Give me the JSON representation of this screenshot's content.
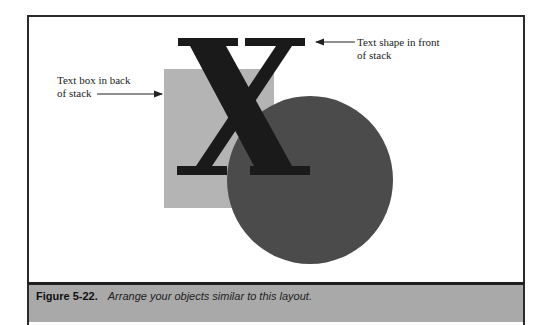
{
  "figure": {
    "annotations": {
      "front": "Text shape in front\nof stack",
      "back": "Text box in back\nof stack"
    },
    "shapes": {
      "letter": "X",
      "colors": {
        "letter": "#1a1a1a",
        "text_box": "#b4b4b4",
        "circle": "#4b4b4b",
        "caption_band": "#a9a9a9"
      }
    },
    "caption": {
      "label": "Figure 5-22.",
      "text": "Arrange your objects similar to this layout."
    }
  }
}
